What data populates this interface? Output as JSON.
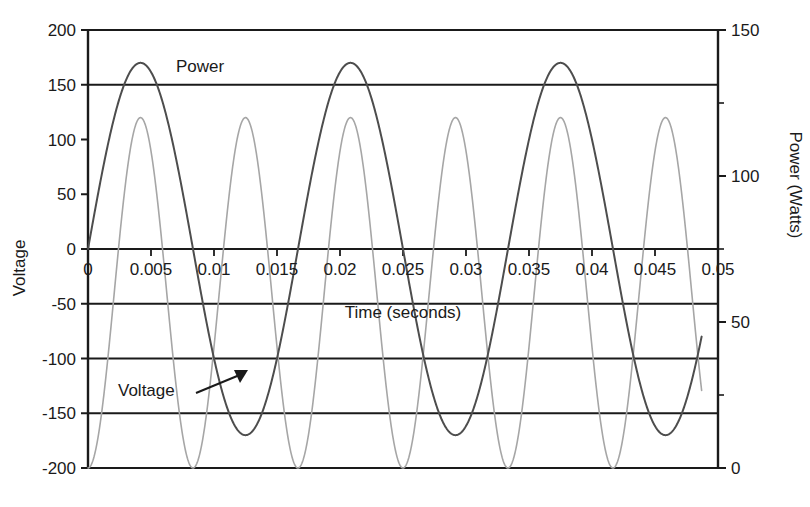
{
  "chart_data": {
    "type": "line",
    "title": "",
    "xlabel": "Time (seconds)",
    "ylabel": "Voltage",
    "y2label": "Power (Watts)",
    "xlim": [
      0,
      0.05
    ],
    "ylim": [
      -200,
      200
    ],
    "y2lim": [
      0,
      150
    ],
    "xticks": [
      "0",
      "0.005",
      "0.01",
      "0.015",
      "0.02",
      "0.025",
      "0.03",
      "0.035",
      "0.04",
      "0.045",
      "0.05"
    ],
    "xtick_values": [
      0,
      0.005,
      0.01,
      0.015,
      0.02,
      0.025,
      0.03,
      0.035,
      0.04,
      0.045,
      0.05
    ],
    "yticks": [
      "200",
      "150",
      "100",
      "50",
      "0",
      "-50",
      "-100",
      "-150",
      "-200"
    ],
    "ytick_values": [
      200,
      150,
      100,
      50,
      0,
      -50,
      -100,
      -150,
      -200
    ],
    "y2ticks": [
      "150",
      "100",
      "50",
      "0"
    ],
    "y2tick_values": [
      150,
      100,
      50,
      0
    ],
    "grid": true,
    "gridlines_y": [
      150,
      0,
      -50,
      -100,
      -150
    ],
    "legend_position": "inline-annotations",
    "series": [
      {
        "name": "Voltage",
        "axis": "left",
        "color": "#4d4d4d",
        "width": 2.0,
        "form": "sine",
        "amplitude": 170,
        "frequency_hz": 60,
        "phase": 0,
        "offset": 0,
        "t_start": 0,
        "t_end": 0.0487,
        "peak": 170,
        "trough": -170,
        "peaks_t": [
          0.00417,
          0.02083,
          0.0375
        ],
        "troughs_t": [
          0.0125,
          0.02917,
          0.04583
        ],
        "zero_crossings_t": [
          0,
          0.00833,
          0.01667,
          0.025,
          0.03333,
          0.04167
        ]
      },
      {
        "name": "Power",
        "axis": "right",
        "color": "#a6a6a6",
        "width": 1.6,
        "form": "sine-squared",
        "amplitude": 120,
        "frequency_hz": 120,
        "phase": 0,
        "offset": 0,
        "t_start": 0,
        "t_end": 0.0487,
        "peak": 120,
        "trough": 0,
        "peaks_t": [
          0.00417,
          0.0125,
          0.02083,
          0.02917,
          0.0375,
          0.04583
        ],
        "zeros_t": [
          0,
          0.00833,
          0.01667,
          0.025,
          0.03333,
          0.04167
        ]
      }
    ],
    "annotations": [
      {
        "id": "power-label",
        "text": "Power",
        "x_px": 176,
        "y_px": 72,
        "has_arrow": false
      },
      {
        "id": "voltage-label",
        "text": "Voltage",
        "x_px": 118,
        "y_px": 396,
        "has_arrow": true,
        "arrow_from_px": [
          196,
          391
        ],
        "arrow_to_px": [
          246,
          372
        ]
      }
    ]
  },
  "axes": {
    "x_title": "Time (seconds)",
    "y_left_title": "Voltage",
    "y_right_title": "Power (Watts)"
  },
  "colors": {
    "voltage": "#4d4d4d",
    "power": "#a6a6a6",
    "axis": "#1a1a1a",
    "grid": "#1a1a1a",
    "background": "#ffffff"
  }
}
